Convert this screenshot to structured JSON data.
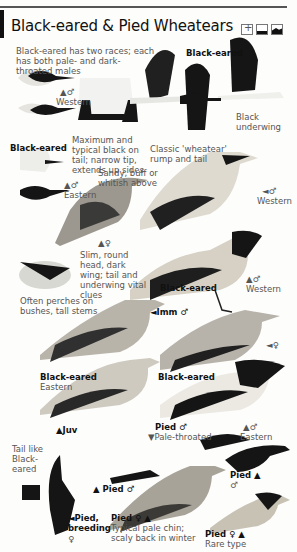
{
  "header": {
    "title": "Black-eared & Pied Wheatears",
    "icons": [
      "habitat-grid-icon",
      "ground-icon",
      "hill-icon"
    ]
  },
  "labels": {
    "intro": "Black-eared has two races; each has both pale- and dark-throated males",
    "western_male_head": "Western",
    "western_male_sex": "▲♂",
    "black_eared_left": "Black-eared",
    "tail_note": "Maximum and typical black on tail; narrow tip, extends up sides",
    "eastern_male_head": "Eastern",
    "eastern_male_sex": "▲♂",
    "black_eared_flight": "Black-eared",
    "black_underwing": "Black underwing",
    "classic_rump": "Classic 'wheatear' rump and tail",
    "sandy_note": "Sandy, buff or whitish above",
    "western_male_pale": "◄♂",
    "western_male_pale_race": "Western",
    "female_sex": "▲♀",
    "slim_note": "Slim, round head, dark wing; tail and underwing vital clues",
    "perches_note": "Often perches on bushes, tall stems",
    "black_eared_mid": "Black-eared",
    "western_male_dark_sex": "▲♂",
    "western_male_dark_race": "Western",
    "imm_male": "◄Imm ♂",
    "female_right": "◄♀",
    "black_eared_eastern": "Black-eared",
    "eastern_race": "Eastern",
    "black_eared_right": "Black-eared",
    "juv": "▲Juv",
    "pied_male_pale": "Pied ♂",
    "pale_throated": "▼Pale-throated",
    "eastern_male_sex2": "▲♂",
    "eastern_race2": "Eastern",
    "tail_like": "Tail like Black-eared",
    "pied_male_flight": "▲ Pied ♂",
    "pied_male_right": "Pied ▲",
    "pied_male_right_sex": "♂",
    "pied_breeding": "◄Pied, breeding",
    "pied_breeding_sex": "♀",
    "pied_female": "Pied ♀ ▲",
    "pied_female_note": "Typical pale chin; scaly back in winter",
    "pied_female_rare": "Pied ♀ ▲",
    "rare_type": "Rare type"
  },
  "colors": {
    "black": "#151515",
    "grey_back": "#8a8a86",
    "buff": "#d9d3c6",
    "white": "#f6f6f4",
    "text_grey": "#555555"
  }
}
